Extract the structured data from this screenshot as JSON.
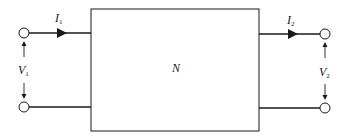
{
  "diagram": {
    "type": "two-port network",
    "network": {
      "label": "N"
    },
    "port1": {
      "current": {
        "symbol": "I",
        "subscript": "1"
      },
      "voltage": {
        "symbol": "V",
        "subscript": "1"
      }
    },
    "port2": {
      "current": {
        "symbol": "I",
        "subscript": "2"
      },
      "voltage": {
        "symbol": "V",
        "subscript": "2"
      }
    },
    "colors": {
      "stroke": "#1a1a1a",
      "background": "#ffffff"
    }
  }
}
